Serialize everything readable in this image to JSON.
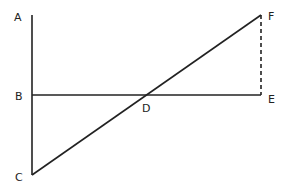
{
  "diagram": {
    "colors": {
      "line": "#222222",
      "background": "#ffffff"
    },
    "points": {
      "A": {
        "label": "A",
        "x": 32,
        "y": 15
      },
      "B": {
        "label": "B",
        "x": 32,
        "y": 95
      },
      "C": {
        "label": "C",
        "x": 32,
        "y": 175
      },
      "D": {
        "label": "D",
        "x": 146,
        "y": 95
      },
      "E": {
        "label": "E",
        "x": 261,
        "y": 95
      },
      "F": {
        "label": "F",
        "x": 261,
        "y": 15
      }
    },
    "segments": [
      {
        "name": "AC",
        "from": "A",
        "to": "C",
        "style": "solid"
      },
      {
        "name": "BE",
        "from": "B",
        "to": "E",
        "style": "solid"
      },
      {
        "name": "CF",
        "from": "C",
        "to": "F",
        "style": "solid"
      },
      {
        "name": "EF",
        "from": "E",
        "to": "F",
        "style": "dashed"
      }
    ]
  }
}
